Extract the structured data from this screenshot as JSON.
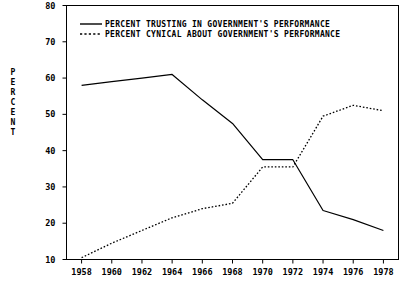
{
  "chart_data": {
    "type": "line",
    "title": "",
    "subtitle": "",
    "xlabel": "",
    "ylabel": "PERCENT",
    "x": [
      1958,
      1960,
      1962,
      1964,
      1966,
      1968,
      1970,
      1972,
      1974,
      1976,
      1978
    ],
    "xlim": [
      1957,
      1979
    ],
    "ylim": [
      10,
      80
    ],
    "xticks": [
      1958,
      1960,
      1962,
      1964,
      1966,
      1968,
      1970,
      1972,
      1974,
      1976,
      1978
    ],
    "yticks": [
      10,
      20,
      30,
      40,
      50,
      60,
      70,
      80
    ],
    "xtick_labels": [
      "1958",
      "1960",
      "1962",
      "1964",
      "1966",
      "1968",
      "1970",
      "1972",
      "1974",
      "1976",
      "1978"
    ],
    "ytick_labels": [
      "10",
      "20",
      "30",
      "40",
      "50",
      "60",
      "70",
      "80"
    ],
    "grid": false,
    "legend_position": "top-left-inside",
    "series": [
      {
        "name": "PERCENT TRUSTING IN GOVERNMENT'S PERFORMANCE",
        "style": "solid",
        "color": "#000000",
        "values": [
          58.0,
          59.0,
          60.0,
          61.0,
          54.0,
          47.5,
          37.5,
          37.5,
          23.5,
          21.0,
          18.0
        ]
      },
      {
        "name": "PERCENT CYNICAL ABOUT GOVERNMENT'S PERFORMANCE",
        "style": "dotted",
        "color": "#000000",
        "values": [
          10.5,
          14.5,
          18.0,
          21.5,
          24.0,
          25.5,
          35.5,
          35.5,
          49.5,
          52.5,
          51.0
        ]
      }
    ]
  },
  "axis": {
    "ylabel_letters": [
      "P",
      "E",
      "R",
      "C",
      "E",
      "N",
      "T"
    ]
  },
  "legend": {
    "entries": [
      {
        "label": "PERCENT TRUSTING IN GOVERNMENT'S PERFORMANCE",
        "style": "solid"
      },
      {
        "label": "PERCENT CYNICAL ABOUT GOVERNMENT'S PERFORMANCE",
        "style": "dotted"
      }
    ]
  }
}
